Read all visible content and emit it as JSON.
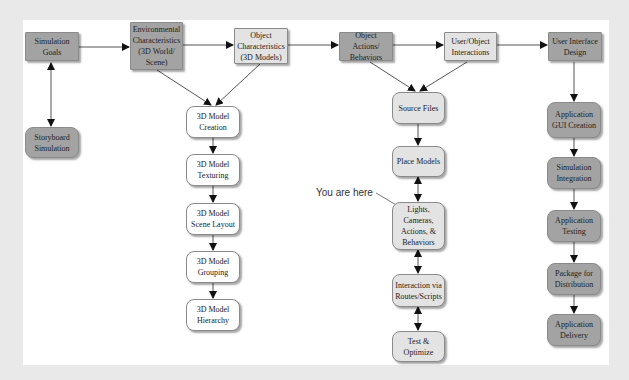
{
  "diagram": {
    "callout": "You are here",
    "nodes": {
      "simulation_goals": "Simulation Goals",
      "storyboard_simulation": "Storyboard Simulation",
      "environmental_characteristics": "Environmental Characteristics (3D World/ Scene)",
      "object_characteristics": "Object Characteristics (3D Models)",
      "object_actions_behaviors": "Object Actions/ Behaviors",
      "user_object_interactions": "User/Object Interactions",
      "user_interface_design": "User Interface Design",
      "model_creation": "3D Model Creation",
      "model_texturing": "3D Model Texturing",
      "model_scene_layout": "3D Model Scene Layout",
      "model_grouping": "3D Model Grouping",
      "model_hierarchy": "3D Model Hierarchy",
      "source_files": "Source Files",
      "place_models": "Place Models",
      "lights_cameras": "Lights, Cameras, Actions, & Behaviors",
      "interaction_routes": "Interaction via Routes/Scripts",
      "test_optimize": "Test & Optimize",
      "gui_creation": "Application GUI Creation",
      "simulation_integration": "Simulation Integration",
      "application_testing": "Application Testing",
      "package_distribution": "Package for Distribution",
      "application_delivery": "Application Delivery"
    }
  }
}
